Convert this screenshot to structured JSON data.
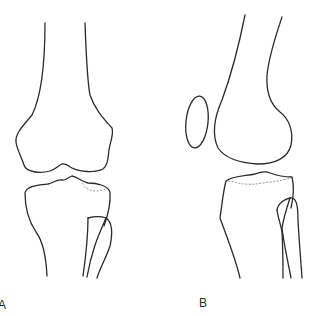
{
  "figure": {
    "panels": [
      {
        "id": "A",
        "label": "A",
        "view": "anterior",
        "structures": [
          "femur",
          "tibia",
          "fibula"
        ]
      },
      {
        "id": "B",
        "label": "B",
        "view": "lateral",
        "structures": [
          "femur",
          "patella",
          "tibia",
          "fibula"
        ]
      }
    ],
    "colors": {
      "stroke": "#2a2a2a",
      "dashed": "#8a8a8a",
      "background": "#ffffff"
    }
  }
}
